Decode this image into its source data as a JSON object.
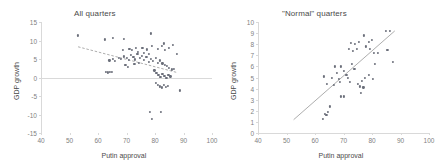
{
  "figure": {
    "background": "#ffffff",
    "point_color": "#6b6f7a",
    "axis_color": "#d9d9d9",
    "text_color": "#7f7f7f"
  },
  "chart_data": [
    {
      "type": "scatter",
      "id": "all-quarters",
      "title": "All quarters",
      "xlabel": "Putin approval",
      "ylabel": "GDP growth",
      "xlim": [
        40,
        100
      ],
      "ylim": [
        -15,
        15
      ],
      "xticks": [
        40,
        50,
        60,
        70,
        80,
        90,
        100
      ],
      "yticks": [
        15,
        10,
        5,
        0,
        -5,
        -10,
        -15
      ],
      "grid": false,
      "legend": "none",
      "zero_line": true,
      "trendline": {
        "style": "dashed",
        "x": [
          53,
          88
        ],
        "y": [
          8.3,
          1.3
        ]
      },
      "points": [
        [
          53.0,
          11.4
        ],
        [
          62.5,
          10.3
        ],
        [
          65.2,
          10.6
        ],
        [
          69.0,
          10.4
        ],
        [
          78.5,
          11.9
        ],
        [
          83.0,
          9.2
        ],
        [
          86.2,
          8.9
        ],
        [
          87.8,
          6.3
        ],
        [
          68.6,
          7.5
        ],
        [
          71.0,
          7.7
        ],
        [
          72.0,
          7.4
        ],
        [
          73.2,
          8.0
        ],
        [
          74.0,
          7.0
        ],
        [
          75.6,
          8.1
        ],
        [
          77.3,
          7.6
        ],
        [
          79.0,
          8.5
        ],
        [
          81.0,
          7.7
        ],
        [
          82.4,
          8.6
        ],
        [
          83.6,
          7.5
        ],
        [
          85.0,
          8.1
        ],
        [
          64.0,
          4.6
        ],
        [
          65.3,
          5.1
        ],
        [
          66.0,
          4.4
        ],
        [
          67.4,
          5.4
        ],
        [
          68.1,
          5.0
        ],
        [
          69.2,
          5.7
        ],
        [
          70.0,
          5.2
        ],
        [
          70.8,
          4.8
        ],
        [
          71.6,
          6.0
        ],
        [
          72.4,
          5.5
        ],
        [
          73.0,
          4.9
        ],
        [
          73.8,
          6.3
        ],
        [
          74.6,
          5.3
        ],
        [
          75.4,
          5.9
        ],
        [
          76.2,
          4.7
        ],
        [
          77.0,
          5.6
        ],
        [
          77.8,
          4.2
        ],
        [
          78.6,
          5.0
        ],
        [
          79.4,
          4.4
        ],
        [
          80.2,
          5.2
        ],
        [
          81.0,
          4.0
        ],
        [
          81.8,
          4.6
        ],
        [
          82.6,
          3.8
        ],
        [
          83.4,
          3.4
        ],
        [
          84.2,
          3.1
        ],
        [
          85.0,
          2.6
        ],
        [
          85.8,
          2.2
        ],
        [
          86.6,
          2.4
        ],
        [
          62.8,
          1.5
        ],
        [
          63.5,
          1.4
        ],
        [
          64.2,
          1.6
        ],
        [
          64.8,
          1.5
        ],
        [
          79.8,
          1.9
        ],
        [
          80.5,
          1.2
        ],
        [
          81.2,
          0.7
        ],
        [
          81.9,
          0.2
        ],
        [
          82.6,
          1.0
        ],
        [
          83.3,
          0.5
        ],
        [
          84.0,
          -0.2
        ],
        [
          84.7,
          0.8
        ],
        [
          85.4,
          0.3
        ],
        [
          80.3,
          -1.4
        ],
        [
          81.0,
          -2.0
        ],
        [
          81.7,
          -2.4
        ],
        [
          82.4,
          -2.7
        ],
        [
          83.1,
          -2.1
        ],
        [
          83.8,
          -2.6
        ],
        [
          84.5,
          -2.3
        ],
        [
          88.8,
          -3.5
        ],
        [
          78.3,
          -9.2
        ],
        [
          79.0,
          -11.2
        ],
        [
          82.0,
          -9.4
        ],
        [
          69.6,
          3.3
        ],
        [
          70.4,
          2.9
        ],
        [
          76.0,
          6.6
        ],
        [
          78.0,
          6.4
        ],
        [
          72.8,
          3.6
        ],
        [
          74.4,
          3.9
        ]
      ]
    },
    {
      "type": "scatter",
      "id": "normal-quarters",
      "title": "\"Normal\" quarters",
      "xlabel": "Putin approval",
      "ylabel": "GDP growth",
      "xlim": [
        40,
        100
      ],
      "ylim": [
        0,
        10
      ],
      "xticks": [
        40,
        50,
        60,
        70,
        80,
        90,
        100
      ],
      "yticks": [
        10,
        9,
        8,
        7,
        6,
        5,
        4,
        3,
        2,
        1,
        0
      ],
      "grid": false,
      "legend": "none",
      "zero_line": false,
      "trendline": {
        "style": "solid",
        "x": [
          52.5,
          88.0
        ],
        "y": [
          1.2,
          9.2
        ]
      },
      "points": [
        [
          62.8,
          1.3
        ],
        [
          63.4,
          1.7
        ],
        [
          64.0,
          1.6
        ],
        [
          64.6,
          1.9
        ],
        [
          65.2,
          2.4
        ],
        [
          63.0,
          5.1
        ],
        [
          64.2,
          4.4
        ],
        [
          66.0,
          5.0
        ],
        [
          67.0,
          6.0
        ],
        [
          67.8,
          5.4
        ],
        [
          68.4,
          4.9
        ],
        [
          69.0,
          6.0
        ],
        [
          69.2,
          3.3
        ],
        [
          70.2,
          3.3
        ],
        [
          70.0,
          5.6
        ],
        [
          71.0,
          5.2
        ],
        [
          71.6,
          5.0
        ],
        [
          72.2,
          4.6
        ],
        [
          71.8,
          7.6
        ],
        [
          72.6,
          8.1
        ],
        [
          73.4,
          7.4
        ],
        [
          74.0,
          8.0
        ],
        [
          74.8,
          7.6
        ],
        [
          75.4,
          8.2
        ],
        [
          75.0,
          4.4
        ],
        [
          75.8,
          4.2
        ],
        [
          76.4,
          4.7
        ],
        [
          76.0,
          3.6
        ],
        [
          77.0,
          4.1
        ],
        [
          77.6,
          5.0
        ],
        [
          77.2,
          8.8
        ],
        [
          78.0,
          7.8
        ],
        [
          78.8,
          8.2
        ],
        [
          79.4,
          7.6
        ],
        [
          80.0,
          8.4
        ],
        [
          80.6,
          7.2
        ],
        [
          79.0,
          5.2
        ],
        [
          80.2,
          4.9
        ],
        [
          81.0,
          6.2
        ],
        [
          82.0,
          7.2
        ],
        [
          84.8,
          9.2
        ],
        [
          86.2,
          9.2
        ],
        [
          85.4,
          7.5
        ],
        [
          87.4,
          6.4
        ],
        [
          73.0,
          6.2
        ],
        [
          73.8,
          5.8
        ],
        [
          66.6,
          4.3
        ],
        [
          68.8,
          4.6
        ]
      ]
    }
  ]
}
